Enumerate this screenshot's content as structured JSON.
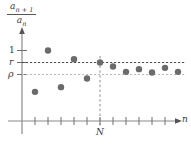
{
  "figure": {
    "title": "",
    "y_axis_label": {
      "numerator": "a",
      "numerator_sub": "n + 1",
      "denominator": "a",
      "denominator_sub": "n"
    },
    "x_axis_label": "n",
    "y_tick_labels": [
      "1",
      "r",
      "ρ"
    ],
    "x_marker_label": "N",
    "colors": {
      "point": "#6b6b6b",
      "axis": "#8a8a8a",
      "r_line": "#4a4a4a",
      "rho_line": "#b9b9b9",
      "n_line": "#8a8a8a",
      "text": "#3a3a3a",
      "background": "#ffffff"
    }
  },
  "chart_data": {
    "type": "scatter",
    "title": "",
    "xlabel": "n",
    "ylabel": "a_{n+1}/a_n",
    "grid": false,
    "legend": null,
    "xlim": [
      0,
      13.5
    ],
    "ylim": [
      0,
      1.25
    ],
    "y_reference_levels": [
      {
        "label": "1",
        "value": 1.0,
        "line": "none",
        "tick": true
      },
      {
        "label": "r",
        "value": 0.82,
        "line": "dashed-dark",
        "tick": true
      },
      {
        "label": "ρ",
        "value": 0.68,
        "line": "dashed-light",
        "tick": true
      }
    ],
    "x_reference_lines": [
      {
        "label": "N",
        "value": 6.0,
        "line": "dashed"
      }
    ],
    "x_tick_count": 12,
    "categories": [
      1,
      2,
      3,
      4,
      5,
      6,
      7,
      8,
      9,
      10,
      11,
      12
    ],
    "values": [
      0.38,
      1.0,
      0.45,
      0.87,
      0.58,
      0.82,
      0.76,
      0.68,
      0.72,
      0.67,
      0.74,
      0.68
    ],
    "series": [
      {
        "name": "a_{n+1}/a_n",
        "points": [
          {
            "x": 1,
            "y": 0.38
          },
          {
            "x": 2,
            "y": 1.0
          },
          {
            "x": 3,
            "y": 0.45
          },
          {
            "x": 4,
            "y": 0.87
          },
          {
            "x": 5,
            "y": 0.58
          },
          {
            "x": 6,
            "y": 0.82
          },
          {
            "x": 7,
            "y": 0.76
          },
          {
            "x": 8,
            "y": 0.68
          },
          {
            "x": 9,
            "y": 0.72
          },
          {
            "x": 10,
            "y": 0.67
          },
          {
            "x": 11,
            "y": 0.74
          },
          {
            "x": 12,
            "y": 0.68
          }
        ]
      }
    ]
  }
}
